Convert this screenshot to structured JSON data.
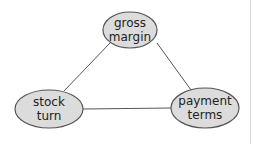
{
  "diagram": {
    "type": "triangle-relationship",
    "colors": {
      "node_fill": "#dcdcdc",
      "node_stroke": "#555555",
      "edge_stroke": "#555555",
      "text": "#222222"
    },
    "nodes": [
      {
        "id": "gross-margin",
        "lines": [
          "gross",
          "margin"
        ],
        "cx": 130,
        "cy": 30,
        "rx": 27,
        "ry": 18
      },
      {
        "id": "stock-turn",
        "lines": [
          "stock",
          "turn"
        ],
        "cx": 49,
        "cy": 109,
        "rx": 34,
        "ry": 19
      },
      {
        "id": "payment-terms",
        "lines": [
          "payment",
          "terms"
        ],
        "cx": 205,
        "cy": 108,
        "rx": 34,
        "ry": 20
      }
    ],
    "edges": [
      {
        "from": "gross-margin",
        "to": "stock-turn",
        "x1": 110,
        "y1": 43,
        "x2": 64,
        "y2": 91
      },
      {
        "from": "gross-margin",
        "to": "payment-terms",
        "x1": 157,
        "y1": 43,
        "x2": 191,
        "y2": 90
      },
      {
        "from": "stock-turn",
        "to": "payment-terms",
        "x1": 83,
        "y1": 109,
        "x2": 171,
        "y2": 108
      }
    ]
  }
}
